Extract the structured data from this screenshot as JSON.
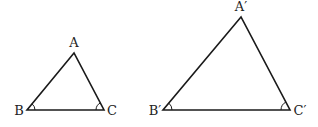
{
  "diagram": {
    "type": "similar-triangles",
    "triangles": [
      {
        "name": "triangle-abc",
        "vertices": {
          "A": {
            "label": "A",
            "x": 74,
            "y": 53
          },
          "B": {
            "label": "B",
            "x": 27,
            "y": 110
          },
          "C": {
            "label": "C",
            "x": 104,
            "y": 110
          }
        },
        "angle_marks": [
          "B",
          "C"
        ]
      },
      {
        "name": "triangle-a-prime-b-prime-c-prime",
        "vertices": {
          "A": {
            "label": "A′",
            "x": 241,
            "y": 17
          },
          "B": {
            "label": "B′",
            "x": 163,
            "y": 110
          },
          "C": {
            "label": "C′",
            "x": 290,
            "y": 110
          }
        },
        "angle_marks": [
          "B′",
          "C′"
        ]
      }
    ],
    "colors": {
      "stroke": "#1a1a1a",
      "text": "#222222",
      "background": "#ffffff"
    }
  }
}
